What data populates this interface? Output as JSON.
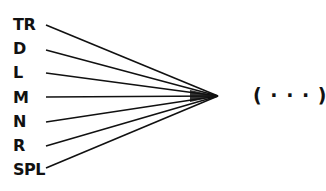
{
  "diagram": {
    "inputs": [
      {
        "label": "TR",
        "y": 25,
        "line_start": [
          46,
          25
        ]
      },
      {
        "label": "D",
        "y": 49,
        "line_start": [
          46,
          50
        ]
      },
      {
        "label": "L",
        "y": 73,
        "line_start": [
          46,
          73
        ]
      },
      {
        "label": "M",
        "y": 98,
        "line_start": [
          46,
          97
        ]
      },
      {
        "label": "N",
        "y": 122,
        "line_start": [
          46,
          122
        ]
      },
      {
        "label": "R",
        "y": 146,
        "line_start": [
          46,
          146
        ]
      },
      {
        "label": "SPL",
        "y": 170,
        "line_start": [
          46,
          168
        ]
      }
    ],
    "convergence_point": [
      218,
      96
    ],
    "output_label": "( · · · )",
    "line_color": "#111111"
  }
}
